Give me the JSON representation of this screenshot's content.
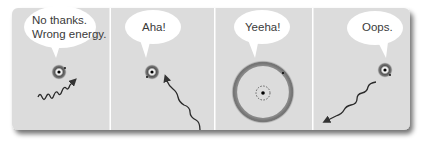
{
  "strip": {
    "background_color": "#dcdcdc",
    "divider_color": "#ffffff",
    "shadow_color": "#8a8a8a"
  },
  "panels": [
    {
      "id": "panel-1",
      "speech": [
        "No thanks.",
        "Wrong energy."
      ],
      "atom_state": "ground",
      "photon": "incoming wavy photon passing by, wrong energy"
    },
    {
      "id": "panel-2",
      "speech": [
        "Aha!"
      ],
      "atom_state": "ground",
      "photon": "incoming wavy photon absorbed by atom"
    },
    {
      "id": "panel-3",
      "speech": [
        "Yeeha!"
      ],
      "atom_state": "excited",
      "photon": "none"
    },
    {
      "id": "panel-4",
      "speech": [
        "Oops."
      ],
      "atom_state": "ground",
      "photon": "outgoing wavy photon emitted from atom"
    }
  ],
  "icons": {
    "atom": "atom-icon",
    "photon": "wavy-arrow-icon",
    "excited_orbit": "orbit-ring-icon"
  }
}
